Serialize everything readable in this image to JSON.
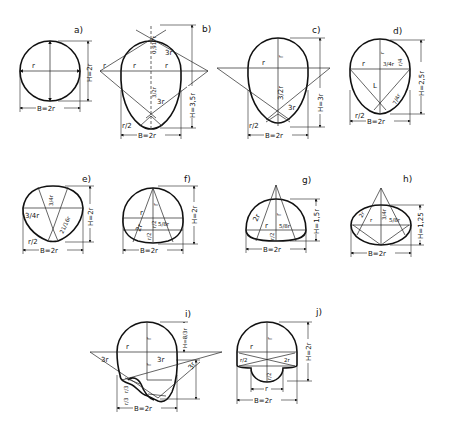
{
  "figure": {
    "panels": [
      {
        "id": "a",
        "label": "a)",
        "shape": "circular",
        "width": "B=2r",
        "height": "H=2r",
        "dims": [
          "r"
        ]
      },
      {
        "id": "b",
        "label": "b)",
        "shape": "tall egg",
        "width": "B=2r",
        "height": "H=3,5r",
        "dims": [
          "r",
          "r",
          "0,917r",
          "3/2r",
          "3r",
          "3r",
          "r/2",
          "r"
        ]
      },
      {
        "id": "c",
        "label": "c)",
        "shape": "egg",
        "width": "B=2r",
        "height": "H=3r",
        "dims": [
          "r",
          "r",
          "3/2r",
          "3r",
          "r/2"
        ]
      },
      {
        "id": "d",
        "label": "d)",
        "shape": "short egg",
        "width": "B=2r",
        "height": "H=2,5r",
        "dims": [
          "r",
          "r",
          "3/4r",
          "r/4",
          "L",
          "7/4r",
          "r/2"
        ]
      },
      {
        "id": "e",
        "label": "e)",
        "shape": "rounded triangle",
        "width": "B=2r",
        "height": "H=2r",
        "dims": [
          "3/4r",
          "3/4r",
          "21/16r",
          "r/2"
        ]
      },
      {
        "id": "f",
        "label": "f)",
        "shape": "horseshoe",
        "width": "B=2r",
        "height": "H=2r",
        "dims": [
          "r",
          "r",
          "2r",
          "r/2",
          "r/2",
          "5/8r"
        ]
      },
      {
        "id": "g",
        "label": "g)",
        "shape": "low arch",
        "width": "B=2r",
        "height": "H=1,5r",
        "dims": [
          "2r",
          "r",
          "r",
          "5/8r",
          "r/2"
        ]
      },
      {
        "id": "h",
        "label": "h)",
        "shape": "flat elliptical",
        "width": "B=2r",
        "height": "H=1,25",
        "dims": [
          "2r",
          "r",
          "3/4r",
          "5/8r"
        ]
      },
      {
        "id": "i",
        "label": "i)",
        "shape": "egg with dry-weather channel",
        "width": "B=2r",
        "height": "H=8/3r",
        "dims": [
          "r",
          "r",
          "r",
          "3r",
          "3r",
          "3r",
          "r/3",
          "r/3"
        ]
      },
      {
        "id": "j",
        "label": "j)",
        "shape": "mouth profile with channel",
        "width": "B=2r",
        "height": "H=2r",
        "dims": [
          "r",
          "r",
          "r/2",
          "2r",
          "r/2",
          "r"
        ]
      }
    ]
  },
  "labels": {
    "a": {
      "title": "a)",
      "r": "r",
      "H": "H=2r",
      "B": "B=2r"
    },
    "b": {
      "title": "b)",
      "r1": "r",
      "r2": "r",
      "r3": "r",
      "top": "0,917r",
      "mid": "3/2r",
      "arc1": "3r",
      "arc2": "3r",
      "bot": "r/2",
      "H": "H=3,5r",
      "B": "B=2r"
    },
    "c": {
      "title": "c)",
      "r1": "r",
      "r2": "r",
      "mid": "3/2r",
      "arc": "3r",
      "bot": "r/2",
      "H": "H=3r",
      "B": "B=2r"
    },
    "d": {
      "title": "d)",
      "r1": "r",
      "r2": "r",
      "q": "3/4r",
      "rq": "r/4",
      "L": "L",
      "s": "7/4r",
      "bot": "r/2",
      "H": "H=2,5r",
      "B": "B=2r"
    },
    "e": {
      "title": "e)",
      "q1": "3/4r",
      "q2": "3/4r",
      "s": "21/16r",
      "bot": "r/2",
      "H": "H=2r",
      "B": "B=2r"
    },
    "f": {
      "title": "f)",
      "r1": "r",
      "r2": "r",
      "r3": "2r",
      "h1": "r/2",
      "h2": "r/2",
      "c": "5/8r",
      "H": "H=2r",
      "B": "B=2r"
    },
    "g": {
      "title": "g)",
      "r1": "2r",
      "r2": "r",
      "r3": "r",
      "c": "5/8r",
      "h": "r/2",
      "H": "H=1,5r",
      "B": "B=2r"
    },
    "h": {
      "title": "h)",
      "r1": "2r",
      "r2": "r",
      "q": "3/4r",
      "c": "5/8r",
      "H": "H=1,25",
      "B": "B=2r"
    },
    "i": {
      "title": "i)",
      "r1": "r",
      "r2": "r",
      "r3": "r",
      "a1": "3r",
      "a2": "3r",
      "a3": "3r",
      "t1": "r/3",
      "t2": "r/3",
      "H": "H=8/3r",
      "B": "B=2r"
    },
    "j": {
      "title": "j)",
      "r1": "r",
      "r2": "r",
      "h": "r/2",
      "r3": "2r",
      "c": "r/2",
      "r4": "r",
      "H": "H=2r",
      "B": "B=2r"
    }
  }
}
